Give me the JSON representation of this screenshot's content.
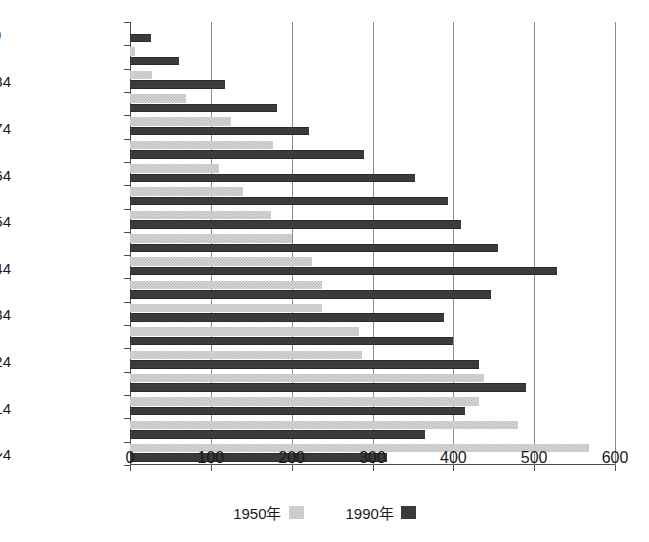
{
  "chart_data": {
    "type": "bar",
    "orientation": "horizontal",
    "title": "",
    "xlabel": "",
    "ylabel": "",
    "xlim": [
      0,
      600
    ],
    "xticks": [
      0,
      100,
      200,
      300,
      400,
      500,
      600
    ],
    "xtick_labels": [
      "0",
      "100",
      "200",
      "300",
      "400",
      "500",
      "600"
    ],
    "grid": "vertical",
    "legend_position": "bottom-center",
    "categories": [
      "0〜4",
      "5〜9",
      "10〜14",
      "15〜19",
      "20〜24",
      "25〜29",
      "30〜34",
      "35〜39",
      "40〜44",
      "45〜49",
      "50〜54",
      "55〜59",
      "60〜64",
      "65〜69",
      "70〜74",
      "75〜79",
      "80〜84",
      "85〜89",
      "90〜94"
    ],
    "visible_category_labels": [
      {
        "category": "0〜4",
        "label": "0〜4"
      },
      {
        "category": "10〜14",
        "label": "10〜14"
      },
      {
        "category": "20〜24",
        "label": "20〜24"
      },
      {
        "category": "30〜34",
        "label": "30〜34"
      },
      {
        "category": "40〜44",
        "label": "40〜44"
      },
      {
        "category": "50〜54",
        "label": "50〜54"
      },
      {
        "category": "60〜64",
        "label": "60〜64"
      },
      {
        "category": "70〜74",
        "label": "70〜74"
      },
      {
        "category": "80〜84",
        "label": "80〜84"
      },
      {
        "category": "90〜94",
        "label": "90〜94（歳）"
      }
    ],
    "series": [
      {
        "name": "1950年",
        "color": "#d7d7d7",
        "pattern": "dotted-light",
        "values": [
          568,
          480,
          432,
          438,
          287,
          283,
          237,
          238,
          225,
          200,
          175,
          140,
          110,
          177,
          125,
          69,
          27,
          6,
          0
        ]
      },
      {
        "name": "1990年",
        "color": "#3b3b3b",
        "pattern": "solid-dark",
        "values": [
          318,
          365,
          415,
          490,
          432,
          400,
          388,
          447,
          528,
          455,
          410,
          393,
          352,
          290,
          222,
          182,
          118,
          60,
          26
        ]
      }
    ]
  },
  "legend": {
    "items": [
      {
        "label": "1950年",
        "swatch": "sw1950"
      },
      {
        "label": "1990年",
        "swatch": "sw1990"
      }
    ]
  },
  "axis": {
    "unit_note": "（歳）"
  }
}
